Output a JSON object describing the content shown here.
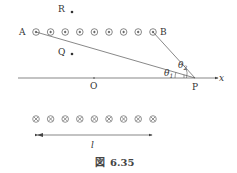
{
  "figure": {
    "caption_prefix": "図",
    "caption_number": "6.35"
  },
  "labels": {
    "R": "R",
    "Q": "Q",
    "A": "A",
    "B": "B",
    "O": "O",
    "P": "P",
    "x": "x",
    "theta1": "θ",
    "theta1_sub": "1",
    "theta2": "θ",
    "theta2_sub": "2",
    "length": "l"
  },
  "top_row": {
    "symbol": "dot-out-of-page",
    "count": 9
  },
  "bottom_row": {
    "symbol": "cross-into-page",
    "count": 9
  },
  "colors": {
    "line": "#555555",
    "text": "#333333"
  }
}
